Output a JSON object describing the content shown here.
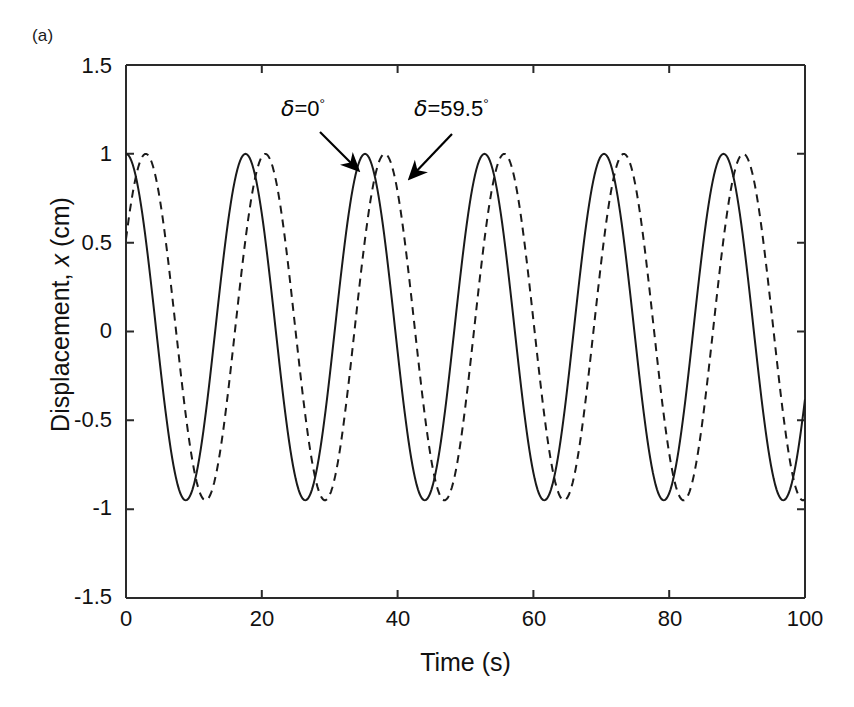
{
  "figure": {
    "panel_label": "(a)",
    "background": "#ffffff",
    "line_color": "#1a1a1a"
  },
  "axes": {
    "x_title": "Time (s)",
    "y_title_prefix": "Displacement, ",
    "y_title_var": "x",
    "y_title_suffix": " (cm)",
    "x_ticks": [
      "0",
      "20",
      "40",
      "60",
      "80",
      "100"
    ],
    "y_ticks": [
      "1.5",
      "1",
      "0.5",
      "0",
      "-0.5",
      "-1",
      "-1.5"
    ]
  },
  "annotations": [
    {
      "name": "delta-zero",
      "symbol": "δ",
      "equals": "=",
      "value": "0",
      "degree": "°",
      "text": "δ=0°"
    },
    {
      "name": "delta-59p5",
      "symbol": "δ",
      "equals": "=",
      "value": "59.5",
      "degree": "°",
      "text": "δ=59.5°"
    }
  ],
  "chart_data": {
    "type": "line",
    "title": "",
    "xlabel": "Time (s)",
    "ylabel": "Displacement, x (cm)",
    "xlim": [
      0,
      100
    ],
    "ylim": [
      -1.5,
      1.5
    ],
    "xticks": [
      0,
      20,
      40,
      60,
      80,
      100
    ],
    "yticks": [
      -1.5,
      -1,
      -0.5,
      0,
      0.5,
      1,
      1.5
    ],
    "grid": false,
    "legend": "none",
    "period_seconds": 17.6,
    "amplitude_cm": 1.0,
    "trough_cm": -0.95,
    "series": [
      {
        "name": "δ=0°",
        "style": "solid",
        "phase_degrees": 0,
        "phase_seconds": 0,
        "x": [
          0,
          4.4,
          8.8,
          13.2,
          17.6,
          22,
          26.4,
          30.8,
          35.2,
          39.6,
          44,
          48.4,
          52.8,
          57.2,
          61.6,
          66,
          70.4,
          74.8,
          79.2,
          83.6,
          88,
          92.4,
          96.8,
          100
        ],
        "y": [
          1.0,
          0.03,
          -0.95,
          0.03,
          1.0,
          0.03,
          -0.95,
          0.03,
          1.0,
          0.03,
          -0.95,
          0.03,
          1.0,
          0.03,
          -0.95,
          0.03,
          1.0,
          0.03,
          -0.95,
          0.03,
          1.0,
          0.03,
          -0.95,
          -0.75
        ]
      },
      {
        "name": "δ=59.5°",
        "style": "dashed",
        "phase_degrees": 59.5,
        "phase_seconds": 2.91,
        "x": [
          0,
          2.9,
          7.3,
          11.7,
          16.1,
          20.5,
          24.9,
          29.3,
          33.7,
          38.1,
          42.5,
          46.9,
          51.3,
          55.7,
          60.1,
          64.5,
          68.9,
          73.3,
          77.7,
          82.1,
          86.5,
          90.9,
          95.3,
          99.7
        ],
        "y": [
          0.51,
          1.0,
          0.03,
          -0.95,
          0.03,
          1.0,
          0.03,
          -0.95,
          0.03,
          1.0,
          0.03,
          -0.95,
          0.03,
          1.0,
          0.03,
          -0.95,
          0.03,
          1.0,
          0.03,
          -0.95,
          0.03,
          1.0,
          0.03,
          -0.95
        ]
      }
    ]
  }
}
